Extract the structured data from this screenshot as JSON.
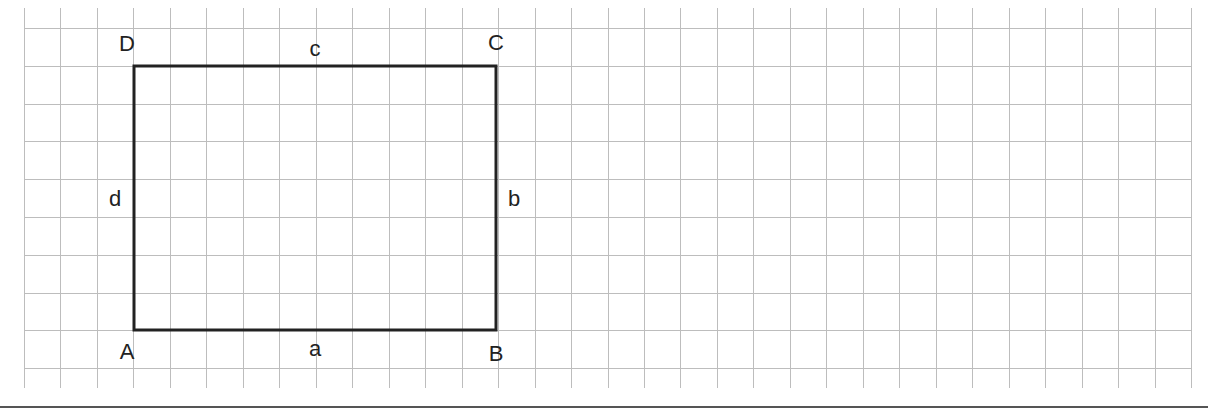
{
  "diagram": {
    "title": "",
    "type": "rectangle-on-grid",
    "grid": {
      "x0": 24,
      "y0": 28,
      "cell_w": 36.47,
      "cell_h": 37.8,
      "cols": 32,
      "rows": 9,
      "v_line_top": 8,
      "v_line_bottom": 388,
      "line_color": "#bdbdbd"
    },
    "rectangle": {
      "x": 134,
      "y": 66,
      "width": 362,
      "height": 264,
      "width_cells": 10,
      "height_cells": 7,
      "stroke": "#222222",
      "stroke_width": 3
    },
    "vertices": [
      {
        "label": "A",
        "x": 127,
        "y": 352
      },
      {
        "label": "B",
        "x": 496,
        "y": 354
      },
      {
        "label": "C",
        "x": 496,
        "y": 43
      },
      {
        "label": "D",
        "x": 127,
        "y": 44
      }
    ],
    "sides": [
      {
        "label": "a",
        "x": 315,
        "y": 349
      },
      {
        "label": "b",
        "x": 514,
        "y": 199
      },
      {
        "label": "c",
        "x": 315,
        "y": 49
      },
      {
        "label": "d",
        "x": 115,
        "y": 199
      }
    ],
    "separator_color": "#555555"
  }
}
